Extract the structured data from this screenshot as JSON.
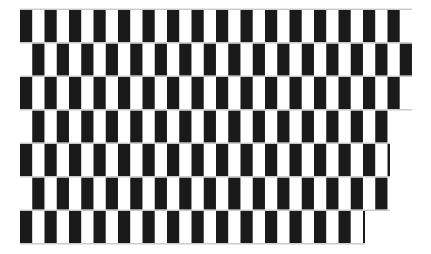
{
  "figure": {
    "name": "cafe-wall-illusion",
    "title": "Cafe Wall Illusion",
    "canvas_width": 431,
    "canvas_height": 254
  },
  "colors": {
    "background": "#ffffff",
    "tile_dark": "#1a1a1a",
    "tile_light": "#ffffff",
    "mortar": "#c9c9c9",
    "edge_fade": "#f4f4f4"
  },
  "geometry": {
    "origin_x": 20,
    "origin_y": 10,
    "pattern_width": 392,
    "pattern_height": 235,
    "row_count": 7,
    "row_height": 33.5,
    "mortar_thickness": 1.4,
    "tile_period": 24.5,
    "tile_dark_width": 12.2,
    "columns_per_row": 16
  },
  "rows": [
    {
      "index": 0,
      "offset": 0.0,
      "y": 10.0,
      "opacity": 1.0,
      "right_limit": 392
    },
    {
      "index": 1,
      "offset": 0.5,
      "y": 43.5,
      "opacity": 1.0,
      "right_limit": 392
    },
    {
      "index": 2,
      "offset": 0.0,
      "y": 77.0,
      "opacity": 1.0,
      "right_limit": 392
    },
    {
      "index": 3,
      "offset": 0.5,
      "y": 110.5,
      "opacity": 1.0,
      "right_limit": 370
    },
    {
      "index": 4,
      "offset": 0.0,
      "y": 144.0,
      "opacity": 1.0,
      "right_limit": 370
    },
    {
      "index": 5,
      "offset": 0.5,
      "y": 177.5,
      "opacity": 1.0,
      "right_limit": 370
    },
    {
      "index": 6,
      "offset": 0.0,
      "y": 211.0,
      "opacity": 1.0,
      "right_limit": 345
    }
  ],
  "annotations": {
    "visible_text": "",
    "labels": []
  }
}
